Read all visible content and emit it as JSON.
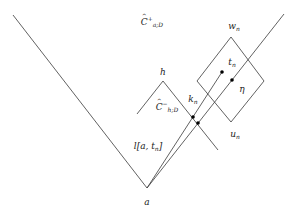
{
  "diagram": {
    "labels": {
      "cone_top": {
        "base": "C",
        "sup": "+",
        "sub": "a;D"
      },
      "small_diamond_top": "h",
      "small_cone": {
        "base": "C",
        "sup": "−",
        "sub": "h;D"
      },
      "big_diamond_top": {
        "base": "w",
        "sub": "n"
      },
      "big_diamond_bottom": {
        "base": "u",
        "sub": "n"
      },
      "point_t": {
        "base": "t",
        "sub": "n"
      },
      "point_eta": "η",
      "point_k": {
        "base": "k",
        "sub": "n"
      },
      "segment": "l[a, t",
      "segment_sub": "n",
      "segment_close": "]",
      "apex": "a"
    },
    "colors": {
      "stroke": "#3a3a3a",
      "dot": "#000000",
      "background": "#ffffff"
    }
  }
}
